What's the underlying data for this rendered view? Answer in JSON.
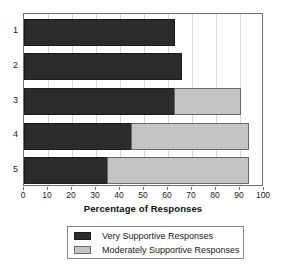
{
  "chart_data": {
    "type": "bar",
    "orientation": "horizontal",
    "stacked": true,
    "title": "",
    "xlabel": "Percentage of Responses",
    "ylabel": "",
    "xlim": [
      0,
      100
    ],
    "xticks": [
      0,
      10,
      20,
      30,
      40,
      50,
      60,
      70,
      80,
      90,
      100
    ],
    "xtick_labels": [
      "0",
      "10",
      "20",
      "30",
      "40",
      "50",
      "60",
      "70",
      "80",
      "90",
      "100"
    ],
    "categories": [
      "1",
      "2",
      "3",
      "4",
      "5"
    ],
    "grid": "vertical",
    "legend_position": "bottom",
    "series": [
      {
        "name": "Very Supportive Responses",
        "color": "#2b2b2b",
        "values": [
          63,
          66,
          63,
          45,
          35
        ]
      },
      {
        "name": "Moderately Supportive Responses",
        "color": "#c4c4c4",
        "values": [
          0,
          0,
          28,
          49,
          59
        ]
      }
    ],
    "totals": [
      63,
      66,
      91,
      94,
      94
    ]
  },
  "legend": {
    "entries": [
      {
        "label": "Very Supportive Responses",
        "swatch": "dark"
      },
      {
        "label": "Moderately Supportive Responses",
        "swatch": "light"
      }
    ]
  },
  "colors": {
    "very_supportive": "#2b2b2b",
    "moderately_supportive": "#c4c4c4",
    "frame": "#6e6e6e",
    "gridline": "#d8d8d8",
    "background": "#ffffff"
  }
}
